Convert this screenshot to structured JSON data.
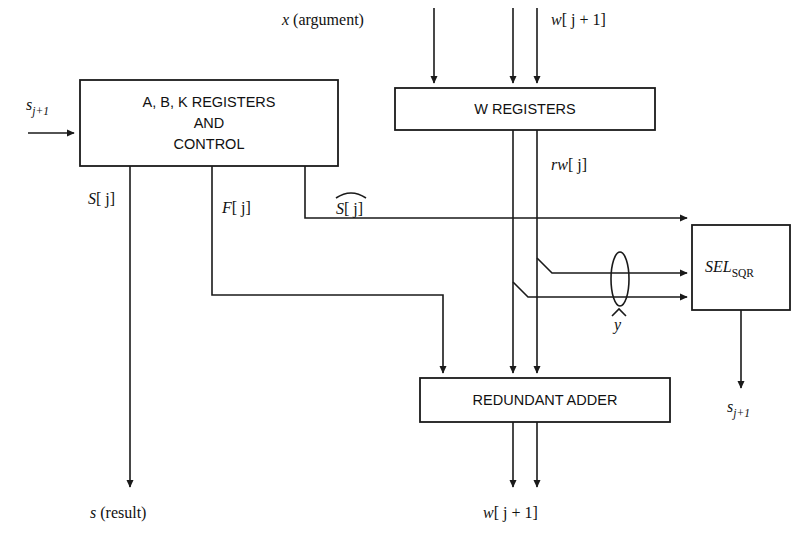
{
  "diagram": {
    "blocks": [
      {
        "id": "abk",
        "label_lines": [
          "A, B, K REGISTERS",
          "AND",
          "CONTROL"
        ],
        "x": 80,
        "y": 80,
        "w": 258,
        "h": 86
      },
      {
        "id": "wreg",
        "label_lines": [
          "W REGISTERS"
        ],
        "x": 395,
        "y": 88,
        "w": 260,
        "h": 42
      },
      {
        "id": "adder",
        "label_lines": [
          "REDUNDANT ADDER"
        ],
        "x": 420,
        "y": 378,
        "w": 250,
        "h": 44
      },
      {
        "id": "sel",
        "label_lines": [
          "SEL_SQR"
        ],
        "x": 692,
        "y": 225,
        "w": 98,
        "h": 85
      }
    ],
    "block_text": {
      "abk_line1": "A, B, K REGISTERS",
      "abk_line2": "AND",
      "abk_line3": "CONTROL",
      "wreg": "W REGISTERS",
      "adder": "REDUNDANT ADDER",
      "sel_main": "SEL",
      "sel_sub": "SQR"
    },
    "signals": {
      "s_in_base": "s",
      "s_in_sub": "j+1",
      "x_argument": "x (argument)",
      "w_in_base": "w",
      "w_in_idx": "[ j + 1]",
      "rw_base": "rw",
      "rw_idx": "[ j]",
      "S_j_base": "S",
      "S_j_idx": "[ j]",
      "F_j_base": "F",
      "F_j_idx": "[ j]",
      "S_hat_base": "S",
      "S_hat_idx": "[ j]",
      "y_hat": "y",
      "s_out_base": "s",
      "s_out_sub": "j+1",
      "s_result": "s (result)",
      "w_out_base": "w",
      "w_out_idx": "[ j + 1]"
    },
    "colors": {
      "ink": "#1a1a1a",
      "paper": "#ffffff"
    }
  }
}
